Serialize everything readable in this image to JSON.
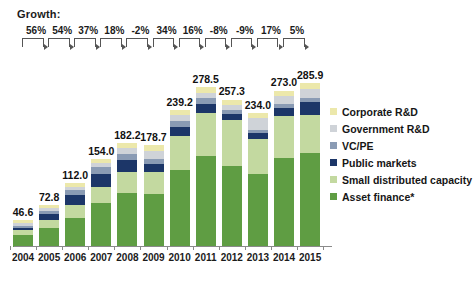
{
  "header": {
    "growth_title": "Growth:",
    "growth_values": [
      "56%",
      "54%",
      "37%",
      "18%",
      "-2%",
      "34%",
      "16%",
      "-8%",
      "-9%",
      "17%",
      "5%"
    ]
  },
  "legend": {
    "items": [
      {
        "label": "Corporate R&D",
        "color": "#ece8ab"
      },
      {
        "label": "Government R&D",
        "color": "#cfd3d8"
      },
      {
        "label": "VC/PE",
        "color": "#8a9bb4"
      },
      {
        "label": "Public markets",
        "color": "#1c3668"
      },
      {
        "label": "Small distributed capacity",
        "color": "#c3d9a0"
      },
      {
        "label": "Asset finance*",
        "color": "#5f9d43"
      }
    ]
  },
  "chart_data": {
    "type": "bar",
    "stacked": true,
    "title": "",
    "subtitle": "",
    "xlabel": "",
    "ylabel": "",
    "grid": false,
    "legend_position": "right",
    "ylim": [
      0,
      300
    ],
    "categories": [
      "2004",
      "2005",
      "2006",
      "2007",
      "2008",
      "2009",
      "2010",
      "2011",
      "2012",
      "2013",
      "2014",
      "2015"
    ],
    "totals": [
      46.6,
      72.8,
      112.0,
      154.0,
      182.2,
      178.7,
      239.2,
      278.5,
      257.3,
      234.0,
      273.0,
      285.9
    ],
    "total_labels": [
      "46.6",
      "72.8",
      "112.0",
      "154.0",
      "182.2",
      "178.7",
      "239.2",
      "278.5",
      "257.3",
      "234.0",
      "273.0",
      "285.9"
    ],
    "growth_percent": [
      56,
      54,
      37,
      18,
      -2,
      34,
      16,
      -8,
      -9,
      17,
      5
    ],
    "series": [
      {
        "name": "Asset finance*",
        "color": "#5f9d43",
        "values": [
          21.0,
          33.0,
          51.0,
          76.0,
          95.0,
          93.0,
          134.0,
          158.0,
          142.0,
          128.0,
          155.0,
          164.0
        ]
      },
      {
        "name": "Small distributed capacity",
        "color": "#c3d9a0",
        "values": [
          9.0,
          15.0,
          23.0,
          29.0,
          35.0,
          37.0,
          60.0,
          76.0,
          80.0,
          60.0,
          73.0,
          67.0
        ]
      },
      {
        "name": "Public markets",
        "color": "#1c3668",
        "values": [
          4.0,
          9.0,
          16.0,
          23.0,
          21.0,
          15.0,
          16.0,
          16.0,
          10.0,
          11.0,
          15.0,
          22.0
        ]
      },
      {
        "name": "VC/PE",
        "color": "#8a9bb4",
        "values": [
          3.0,
          6.0,
          9.0,
          11.0,
          11.0,
          9.0,
          9.0,
          10.0,
          7.0,
          6.0,
          7.0,
          7.0
        ]
      },
      {
        "name": "Government R&D",
        "color": "#cfd3d8",
        "values": [
          4.4,
          4.8,
          6.0,
          7.0,
          10.2,
          13.7,
          11.2,
          9.5,
          9.3,
          20.0,
          14.0,
          15.9
        ]
      },
      {
        "name": "Corporate R&D",
        "color": "#ece8ab",
        "values": [
          5.2,
          5.0,
          7.0,
          8.0,
          10.0,
          11.0,
          9.0,
          9.0,
          9.0,
          9.0,
          9.0,
          10.0
        ]
      }
    ]
  }
}
